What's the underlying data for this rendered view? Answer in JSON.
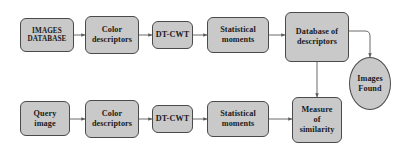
{
  "diagram": {
    "style": {
      "node_fill": "#c9c9c9",
      "node_border": "#4a4a4a",
      "wire_color": "#5a5a5a",
      "background": "#ffffff",
      "text_color": "#1a1a1a"
    },
    "nodes": [
      {
        "id": "images_database",
        "label": "IMAGES\nDATABASE",
        "shape": "rounded-rect",
        "row": "indexing"
      },
      {
        "id": "color_desc_top",
        "label": "Color\ndescriptors",
        "shape": "rounded-rect",
        "row": "indexing"
      },
      {
        "id": "dtcwt_top",
        "label": "DT-CWT",
        "shape": "rounded-rect",
        "row": "indexing"
      },
      {
        "id": "stat_moments_top",
        "label": "Statistical\nmoments",
        "shape": "rounded-rect",
        "row": "indexing"
      },
      {
        "id": "database_descriptors",
        "label": "Database of\ndescriptors",
        "shape": "rounded-rect",
        "row": "indexing"
      },
      {
        "id": "query_image",
        "label": "Query\nimage",
        "shape": "rounded-rect",
        "row": "query"
      },
      {
        "id": "color_desc_bottom",
        "label": "Color\ndescriptors",
        "shape": "rounded-rect",
        "row": "query"
      },
      {
        "id": "dtcwt_bottom",
        "label": "DT-CWT",
        "shape": "rounded-rect",
        "row": "query"
      },
      {
        "id": "stat_moments_bottom",
        "label": "Statistical\nmoments",
        "shape": "rounded-rect",
        "row": "query"
      },
      {
        "id": "measure_similarity",
        "label": "Measure\nof\nsimilarity",
        "shape": "rounded-rect",
        "row": "query"
      },
      {
        "id": "images_found",
        "label": "Images\nFound",
        "shape": "ellipse",
        "row": "output"
      }
    ],
    "edges": [
      {
        "from": "images_database",
        "to": "color_desc_top",
        "direction": "forward"
      },
      {
        "from": "color_desc_top",
        "to": "dtcwt_top",
        "direction": "forward"
      },
      {
        "from": "dtcwt_top",
        "to": "stat_moments_top",
        "direction": "forward"
      },
      {
        "from": "stat_moments_top",
        "to": "database_descriptors",
        "direction": "forward"
      },
      {
        "from": "query_image",
        "to": "color_desc_bottom",
        "direction": "forward"
      },
      {
        "from": "color_desc_bottom",
        "to": "dtcwt_bottom",
        "direction": "forward"
      },
      {
        "from": "dtcwt_bottom",
        "to": "stat_moments_bottom",
        "direction": "forward"
      },
      {
        "from": "stat_moments_bottom",
        "to": "measure_similarity",
        "direction": "forward"
      },
      {
        "from": "database_descriptors",
        "to": "measure_similarity",
        "direction": "bidirectional"
      },
      {
        "from": "database_descriptors",
        "to": "images_found",
        "direction": "forward"
      }
    ]
  }
}
